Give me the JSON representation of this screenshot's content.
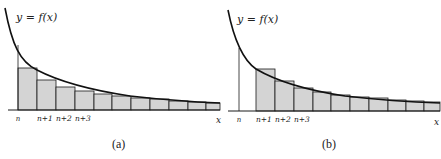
{
  "chart_data": [
    {
      "type": "diagram",
      "panel": "a",
      "caption": "(a)",
      "curve_label": "y = f(x)",
      "x_axis_label": "x",
      "tick_labels": [
        "n",
        "n+1",
        "n+2",
        "n+3"
      ],
      "description": "Decreasing curve y=f(x) with left-endpoint rectangles starting at n, each of width 1, lying above the curve (upper sum)",
      "rectangles": 11,
      "rectangle_fill": "#d4d4d4"
    },
    {
      "type": "diagram",
      "panel": "b",
      "caption": "(b)",
      "curve_label": "y = f(x)",
      "x_axis_label": "x",
      "tick_labels": [
        "n",
        "n+1",
        "n+2",
        "n+3"
      ],
      "description": "Decreasing curve y=f(x) with right-endpoint rectangles starting at n+1, each of width 1, lying below the curve (lower sum)",
      "rectangles": 10,
      "rectangle_fill": "#d4d4d4"
    }
  ],
  "panels": {
    "a": {
      "caption": "(a)",
      "curve_label": "y = f(x)",
      "x_label": "x",
      "ticks": [
        {
          "label": "n",
          "x": 18
        },
        {
          "label": "n+1",
          "x": 37
        },
        {
          "label": "n+2",
          "x": 56
        },
        {
          "label": "n+3",
          "x": 75
        }
      ],
      "bars": [
        {
          "x": 18,
          "top": 68
        },
        {
          "x": 37,
          "top": 80
        },
        {
          "x": 56,
          "top": 87
        },
        {
          "x": 75,
          "top": 91
        },
        {
          "x": 94,
          "top": 94
        },
        {
          "x": 112,
          "top": 96
        },
        {
          "x": 131,
          "top": 98
        },
        {
          "x": 150,
          "top": 99
        },
        {
          "x": 169,
          "top": 101
        },
        {
          "x": 188,
          "top": 102
        },
        {
          "x": 206,
          "top": 103
        }
      ]
    },
    "b": {
      "caption": "(b)",
      "curve_label": "y = f(x)",
      "x_label": "x",
      "ticks": [
        {
          "label": "n",
          "x": 239
        },
        {
          "label": "n+1",
          "x": 256
        },
        {
          "label": "n+2",
          "x": 275
        },
        {
          "label": "n+3",
          "x": 294
        }
      ],
      "bars": [
        {
          "x": 256,
          "top": 69
        },
        {
          "x": 275,
          "top": 81
        },
        {
          "x": 294,
          "top": 88
        },
        {
          "x": 313,
          "top": 92
        },
        {
          "x": 331,
          "top": 95
        },
        {
          "x": 350,
          "top": 97
        },
        {
          "x": 369,
          "top": 98
        },
        {
          "x": 388,
          "top": 100
        },
        {
          "x": 406,
          "top": 101
        },
        {
          "x": 424,
          "top": 102
        }
      ]
    },
    "colors": {
      "bar_fill": "#d4d4d4",
      "stroke": "#1a1a1a",
      "curve": "#111111"
    }
  }
}
